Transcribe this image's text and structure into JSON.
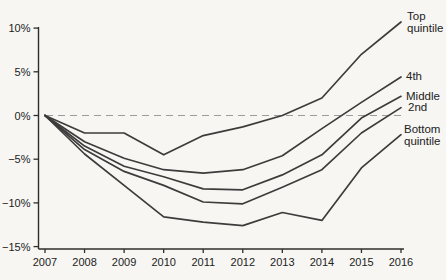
{
  "figure": {
    "background": "#f7f6f3",
    "series_color": "#3c3c3c",
    "axis_color": "#2e2e2e",
    "text_color": "#1f1f1f",
    "zero_line_color": "#9b9b9b"
  },
  "chart_data": {
    "type": "line",
    "title": "",
    "xlabel": "",
    "ylabel": "",
    "x": [
      2007,
      2008,
      2009,
      2010,
      2011,
      2012,
      2013,
      2014,
      2015,
      2016
    ],
    "x_tick_labels": [
      "2007",
      "2008",
      "2009",
      "2010",
      "2011",
      "2012",
      "2013",
      "2014",
      "2015",
      "2016"
    ],
    "y_ticks": [
      10,
      5,
      0,
      -5,
      -10,
      -15
    ],
    "y_tick_labels": [
      "10%",
      "5%",
      "0%",
      "−5%",
      "−10%",
      "−15%"
    ],
    "ylim": [
      -15,
      11
    ],
    "grid": false,
    "zero_reference_line": "dashed",
    "legend_position": "right-end-labels",
    "series": [
      {
        "name": "Top quintile",
        "label_lines": [
          "Top",
          "quintile"
        ],
        "values": [
          0,
          -2.0,
          -2.0,
          -4.5,
          -2.3,
          -1.3,
          0.0,
          2.0,
          7.0,
          10.7
        ]
      },
      {
        "name": "4th",
        "label_lines": [
          "4th"
        ],
        "values": [
          0,
          -3.0,
          -4.9,
          -6.2,
          -6.6,
          -6.2,
          -4.6,
          -1.5,
          1.5,
          4.4
        ]
      },
      {
        "name": "Middle",
        "label_lines": [
          "Middle"
        ],
        "values": [
          0,
          -3.5,
          -5.8,
          -7.0,
          -8.4,
          -8.5,
          -6.8,
          -4.5,
          -0.3,
          2.2
        ]
      },
      {
        "name": "2nd",
        "label_lines": [
          "2nd"
        ],
        "values": [
          0,
          -3.9,
          -6.4,
          -8.0,
          -9.9,
          -10.1,
          -8.2,
          -6.2,
          -2.0,
          0.9
        ]
      },
      {
        "name": "Bottom quintile",
        "label_lines": [
          "Bottom",
          "quintile"
        ],
        "values": [
          0,
          -4.4,
          -8.0,
          -11.6,
          -12.2,
          -12.6,
          -11.1,
          -12.0,
          -6.0,
          -2.2
        ]
      }
    ]
  }
}
